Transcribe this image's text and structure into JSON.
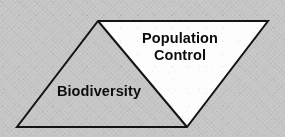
{
  "image": {
    "width": 285,
    "height": 137,
    "background_color": "#c9c9c9",
    "texture": "dithered-halftone-scan"
  },
  "diagram": {
    "type": "parallelogram-split-into-two-triangles",
    "stroke_color": "#141414",
    "stroke_width": 2,
    "outline": {
      "name": "parallelogram",
      "points": "98,21 268,21 187,127 17,127"
    },
    "regions": [
      {
        "name": "population-control-triangle",
        "label": "Population\nControl",
        "label_lines": [
          "Population",
          "Control"
        ],
        "fill_color": "#fdfdfd",
        "points": "98,21 268,21 187,127"
      },
      {
        "name": "biodiversity-triangle",
        "label": "Biodiversity",
        "label_lines": [
          "Biodiversity"
        ],
        "fill_color": "#c9c9c9",
        "points": "98,21 187,127 17,127"
      }
    ],
    "divider": {
      "name": "diagonal-divider",
      "from": "98,21",
      "to": "187,127"
    }
  },
  "labels": {
    "population_control": "Population\nControl",
    "biodiversity": "Biodiversity"
  }
}
